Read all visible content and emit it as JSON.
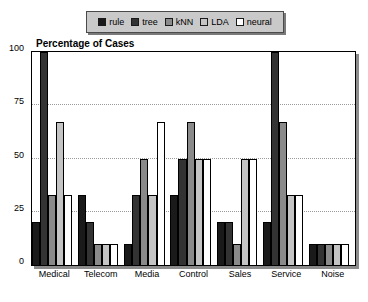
{
  "chart_data": {
    "type": "bar",
    "title": "Percentage of Cases",
    "xlabel": "",
    "ylabel": "",
    "ylim": [
      0,
      100
    ],
    "yticks": [
      0,
      25,
      50,
      75,
      100
    ],
    "grid": true,
    "legend_position": "top",
    "categories": [
      "Medical",
      "Telecom",
      "Media",
      "Control",
      "Sales",
      "Service",
      "Noise"
    ],
    "series": [
      {
        "name": "rule",
        "color": "#1a1a1a",
        "values": [
          20,
          33,
          10,
          33,
          20,
          20,
          10
        ]
      },
      {
        "name": "tree",
        "color": "#333333",
        "values": [
          100,
          20,
          33,
          50,
          20,
          100,
          10
        ]
      },
      {
        "name": "kNN",
        "color": "#8a8a8a",
        "values": [
          33,
          10,
          50,
          67,
          10,
          67,
          10
        ]
      },
      {
        "name": "LDA",
        "color": "#c4c4c4",
        "values": [
          67,
          10,
          33,
          50,
          50,
          33,
          10
        ]
      },
      {
        "name": "neural",
        "color": "#ffffff",
        "values": [
          33,
          10,
          67,
          50,
          50,
          33,
          10
        ]
      }
    ]
  },
  "legend": {
    "items": [
      {
        "label": "rule",
        "swatch": "#1a1a1a"
      },
      {
        "label": "tree",
        "swatch": "#333333"
      },
      {
        "label": "kNN",
        "swatch": "#8a8a8a"
      },
      {
        "label": "LDA",
        "swatch": "#c4c4c4"
      },
      {
        "label": "neural",
        "swatch": "#ffffff"
      }
    ]
  },
  "colors": {
    "legend_background": "#c9c9c9",
    "legend_border": "#4a4a4a",
    "axis": "#000000",
    "gridline": "#9a9a9a",
    "plot_background": "#ffffff"
  }
}
